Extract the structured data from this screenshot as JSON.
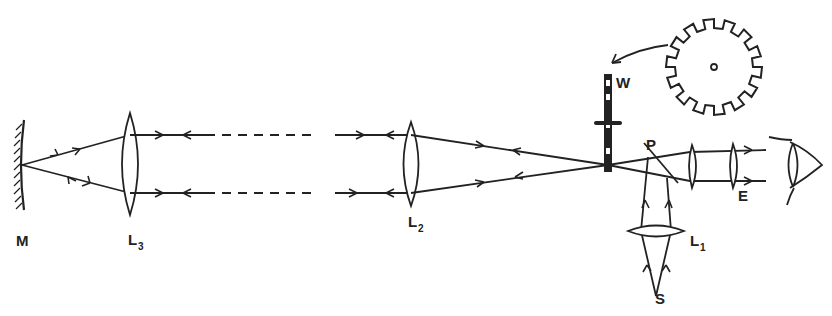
{
  "diagram": {
    "labels": {
      "mirror": "M",
      "lens3": "L",
      "lens3_sub": "3",
      "lens2": "L",
      "lens2_sub": "2",
      "lens1": "L",
      "lens1_sub": "1",
      "wheel": "W",
      "plate": "P",
      "eyepiece": "E",
      "source": "S"
    },
    "components": [
      {
        "id": "M",
        "type": "concave mirror"
      },
      {
        "id": "L3",
        "type": "convex lens"
      },
      {
        "id": "L2",
        "type": "convex lens"
      },
      {
        "id": "W",
        "type": "toothed wheel (edge view)"
      },
      {
        "id": "P",
        "type": "half-silvered plate"
      },
      {
        "id": "E",
        "type": "eyepiece"
      },
      {
        "id": "L1",
        "type": "condenser lens"
      },
      {
        "id": "S",
        "type": "light source"
      }
    ],
    "colors": {
      "ink": "#222222",
      "background": "#ffffff"
    }
  }
}
